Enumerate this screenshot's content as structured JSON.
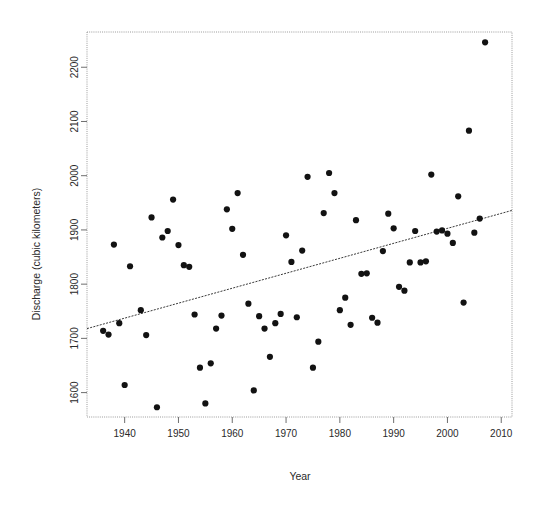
{
  "chart_data": {
    "type": "scatter",
    "title": "",
    "xlabel": "Year",
    "ylabel": "Discharge (cubic kilometers)",
    "xlim": [
      1933,
      2012
    ],
    "ylim": [
      1555,
      2265
    ],
    "grid": false,
    "legend": "none",
    "x_ticks": [
      1940,
      1950,
      1960,
      1970,
      1980,
      1990,
      2000,
      2010
    ],
    "y_ticks": [
      1600,
      1700,
      1800,
      1900,
      2000,
      2100,
      2200
    ],
    "x_tick_labels": [
      "1940",
      "1950",
      "1960",
      "1970",
      "1980",
      "1990",
      "2000",
      "2010"
    ],
    "y_tick_labels": [
      "1600",
      "1700",
      "1800",
      "1900",
      "2000",
      "2100",
      "2200"
    ],
    "point_color": "#121212",
    "point_radius": 3.1,
    "series": [
      {
        "name": "Annual discharge",
        "x": [
          1936,
          1937,
          1938,
          1939,
          1940,
          1941,
          1943,
          1944,
          1945,
          1946,
          1947,
          1948,
          1949,
          1950,
          1951,
          1952,
          1953,
          1954,
          1955,
          1956,
          1957,
          1958,
          1959,
          1960,
          1961,
          1962,
          1963,
          1964,
          1965,
          1966,
          1967,
          1968,
          1969,
          1970,
          1971,
          1972,
          1973,
          1974,
          1975,
          1976,
          1977,
          1978,
          1979,
          1980,
          1981,
          1982,
          1983,
          1984,
          1985,
          1986,
          1987,
          1988,
          1989,
          1990,
          1991,
          1992,
          1993,
          1994,
          1995,
          1996,
          1997,
          1998,
          1999,
          2000,
          2001,
          2002,
          2003,
          2004,
          2005,
          2006,
          2007
        ],
        "y": [
          1714,
          1707,
          1873,
          1728,
          1614,
          1833,
          1752,
          1706,
          1923,
          1573,
          1886,
          1898,
          1956,
          1872,
          1835,
          1832,
          1744,
          1646,
          1580,
          1654,
          1718,
          1742,
          1938,
          1902,
          1968,
          1854,
          1764,
          1604,
          1741,
          1718,
          1666,
          1728,
          1745,
          1890,
          1841,
          1739,
          1862,
          1998,
          1646,
          1694,
          1931,
          2005,
          1968,
          1752,
          1775,
          1725,
          1918,
          1819,
          1820,
          1738,
          1729,
          1861,
          1930,
          1903,
          1795,
          1788,
          1840,
          1898,
          1840,
          1842,
          2002,
          1897,
          1899,
          1893,
          1876,
          1962,
          1766,
          2083,
          1895,
          1921,
          2246
        ],
        "marker": "filled-circle"
      }
    ],
    "trendline": {
      "type": "linear-fit",
      "style": "dashed",
      "x_start": 1933,
      "y_start": 1718,
      "x_end": 2012,
      "y_end": 1936
    }
  }
}
